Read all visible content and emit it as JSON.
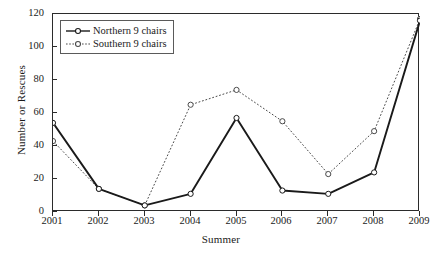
{
  "chart_data": {
    "type": "line",
    "title": "",
    "xlabel": "Summer",
    "ylabel": "Number or Rescues",
    "categories": [
      "2001",
      "2002",
      "2003",
      "2004",
      "2005",
      "2006",
      "2007",
      "2008",
      "2009"
    ],
    "x": [
      2001,
      2002,
      2003,
      2004,
      2005,
      2006,
      2007,
      2008,
      2009
    ],
    "xlim": [
      2001,
      2009
    ],
    "ylim": [
      0,
      120
    ],
    "yticks": [
      0,
      20,
      40,
      60,
      80,
      100,
      120
    ],
    "xticks": [
      "2001",
      "2002",
      "2003",
      "2004",
      "2005",
      "2006",
      "2007",
      "2008",
      "2009"
    ],
    "grid": false,
    "legend_position": "upper-left",
    "series": [
      {
        "name": "Northern 9 chairs",
        "values": [
          54,
          14,
          4,
          11,
          57,
          13,
          11,
          24,
          116
        ],
        "line_style": "solid",
        "marker": "circle-open",
        "color": "#1a1a1a"
      },
      {
        "name": "Southern 9 chairs",
        "values": [
          43,
          14,
          4,
          65,
          74,
          55,
          23,
          49,
          117
        ],
        "line_style": "dotted",
        "marker": "circle-open",
        "color": "#4a4a4a"
      }
    ]
  },
  "axes": {
    "y_tick_labels": [
      "120",
      "100",
      "80",
      "60",
      "40",
      "20",
      "0"
    ],
    "x_tick_labels": [
      "2001",
      "2002",
      "2003",
      "2004",
      "2005",
      "2006",
      "2007",
      "2008",
      "2009"
    ],
    "y_title": "Number or Rescues",
    "x_title": "Summer"
  },
  "legend": {
    "items": [
      {
        "label": "Northern 9 chairs",
        "style": "solid"
      },
      {
        "label": "Southern 9 chairs",
        "style": "dotted"
      }
    ]
  },
  "colors": {
    "northern": "#1a1a1a",
    "southern": "#4a4a4a",
    "frame": "#2b2b2b",
    "background": "#ffffff"
  }
}
